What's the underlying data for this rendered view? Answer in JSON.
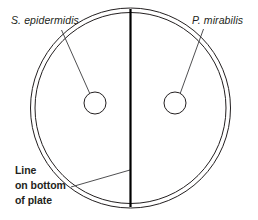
{
  "diagram": {
    "canvas": {
      "width": 258,
      "height": 220,
      "background": "#ffffff"
    },
    "colors": {
      "ink": "#231f20",
      "line": "#000000",
      "leader": "#3b3b3d",
      "fill": "#ffffff"
    },
    "plate": {
      "name": "petri-plate",
      "center_x": 130.5,
      "center_y": 108,
      "outer_radius": 100,
      "inner_radius": 95.5
    },
    "divider": {
      "name": "dividing-line",
      "x": 130.5,
      "y_top": 9,
      "y_bottom": 207
    },
    "colonies": [
      {
        "id": "left-colony",
        "cx": 95,
        "cy": 103,
        "r": 11
      },
      {
        "id": "right-colony",
        "cx": 175,
        "cy": 103,
        "r": 11
      }
    ],
    "labels": {
      "left_species": "S. epidermidis",
      "right_species": "P. mirabilis",
      "note_line_1": "Line",
      "note_line_2": "on bottom",
      "note_line_3": "of plate"
    },
    "label_positions": {
      "left_species": {
        "x": 11,
        "y": 24
      },
      "right_species": {
        "x": 192,
        "y": 24
      },
      "note_line_1": {
        "x": 15,
        "y": 174
      },
      "note_line_2": {
        "x": 15,
        "y": 189
      },
      "note_line_3": {
        "x": 15,
        "y": 204
      }
    },
    "leaders": [
      {
        "id": "left-species-leader",
        "x1": 61.5,
        "x2": 90,
        "y1": 30,
        "y2": 94
      },
      {
        "id": "right-species-leader",
        "x1": 203.5,
        "x2": 180,
        "y1": 29,
        "y2": 94
      },
      {
        "id": "note-leader",
        "x1": 71,
        "x2": 130,
        "y1": 187,
        "y2": 170
      }
    ]
  }
}
